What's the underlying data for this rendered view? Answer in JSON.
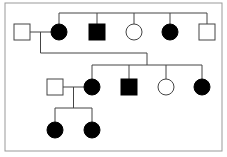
{
  "diagram": {
    "type": "pedigree",
    "colors": {
      "affected": "#000000",
      "unaffected": "#ffffff",
      "line": "#444444",
      "frame": "#999999"
    },
    "generations": [
      {
        "id": "I",
        "individuals": [
          {
            "id": "I-1",
            "sex": "male",
            "affected": false
          },
          {
            "id": "I-2",
            "sex": "female",
            "affected": true
          }
        ]
      },
      {
        "id": "I-siblings-of-I-2",
        "individuals": [
          {
            "id": "I-3",
            "sex": "male",
            "affected": true
          },
          {
            "id": "I-4",
            "sex": "female",
            "affected": false
          },
          {
            "id": "I-5",
            "sex": "female",
            "affected": true
          },
          {
            "id": "I-6",
            "sex": "male",
            "affected": false
          }
        ]
      },
      {
        "id": "II",
        "individuals": [
          {
            "id": "II-1",
            "sex": "male",
            "affected": false
          },
          {
            "id": "II-2",
            "sex": "female",
            "affected": true
          },
          {
            "id": "II-3",
            "sex": "male",
            "affected": true
          },
          {
            "id": "II-4",
            "sex": "female",
            "affected": false
          },
          {
            "id": "II-5",
            "sex": "female",
            "affected": true
          }
        ]
      },
      {
        "id": "III",
        "individuals": [
          {
            "id": "III-1",
            "sex": "female",
            "affected": true
          },
          {
            "id": "III-2",
            "sex": "female",
            "affected": true
          }
        ]
      }
    ],
    "matings": [
      {
        "partners": [
          "I-1",
          "I-2"
        ],
        "children": [
          "II-2",
          "II-3",
          "II-4",
          "II-5"
        ]
      },
      {
        "partners": [
          "II-1",
          "II-2"
        ],
        "children": [
          "III-1",
          "III-2"
        ]
      }
    ],
    "sibships": [
      {
        "members": [
          "I-2",
          "I-3",
          "I-4",
          "I-5",
          "I-6"
        ]
      }
    ]
  }
}
